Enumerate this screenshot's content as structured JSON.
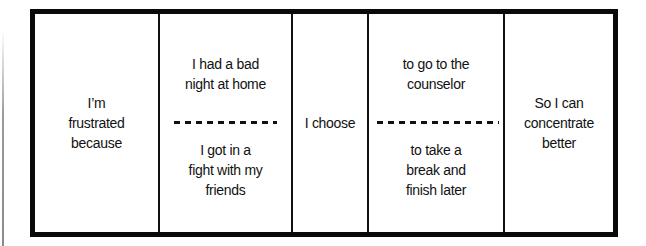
{
  "diagram": {
    "columns": [
      {
        "id": "feeling",
        "text": "I’m\nfrustrated\nbecause"
      },
      {
        "id": "reasons",
        "top": "I had a bad\nnight at home",
        "bottom": "I got in a\nfight with my\nfriends"
      },
      {
        "id": "choice",
        "text": "I choose"
      },
      {
        "id": "actions",
        "top": "to go to the\ncounselor",
        "bottom": "to take a\nbreak and\nfinish later"
      },
      {
        "id": "outcome",
        "text": "So I can\nconcentrate\nbetter"
      }
    ]
  },
  "colors": {
    "border": "#0a0a0a",
    "background": "#ffffff",
    "text": "#111111"
  }
}
